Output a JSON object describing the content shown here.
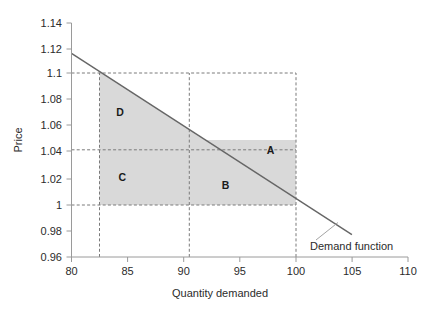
{
  "chart_data": {
    "type": "line",
    "title": "",
    "xlabel": "Quantity demanded",
    "ylabel": "Price",
    "xlim": [
      80,
      110
    ],
    "ylim": [
      0.96,
      1.14
    ],
    "xticks": [
      "80",
      "85",
      "90",
      "95",
      "100",
      "105",
      "110"
    ],
    "xtick_values": [
      80,
      85,
      90,
      95,
      100,
      105,
      110
    ],
    "yticks": [
      "0.96",
      "0.98",
      "1",
      "1.02",
      "1.04",
      "1.06",
      "1.08",
      "1.1",
      "1.12",
      "1.14"
    ],
    "ytick_values": [
      0.96,
      0.98,
      1.0,
      1.02,
      1.04,
      1.06,
      1.08,
      1.1,
      1.12,
      1.14
    ],
    "grid": false,
    "legend_position": "inline-annotation",
    "series": [
      {
        "name": "Demand function",
        "type": "line",
        "color": "#666666",
        "x": [
          80,
          105
        ],
        "y": [
          1.1166,
          0.9772
        ],
        "annotation": "Demand function",
        "annotation_x": 101.5,
        "annotation_y": 0.9845
      }
    ],
    "reference_lines": {
      "horizontal": [
        {
          "value": 1.1,
          "label": "1.1",
          "style": "dashed",
          "from_x": 80,
          "to_x": 100
        },
        {
          "value": 1.05,
          "label": "1.05",
          "style": "dashed",
          "from_x": 80,
          "to_x": 100
        },
        {
          "value": 1.0,
          "label": "1",
          "style": "dashed",
          "from_x": 80,
          "to_x": 100
        }
      ],
      "vertical": [
        {
          "value": 82.5,
          "style": "dashed",
          "from_y": 0.96,
          "to_y": 1.1
        },
        {
          "value": 90.5,
          "style": "dashed",
          "from_y": 0.96,
          "to_y": 1.1
        },
        {
          "value": 100.0,
          "style": "dashed",
          "from_y": 0.96,
          "to_y": 1.1
        }
      ]
    },
    "shaded_regions": [
      {
        "label": "A",
        "fill": "#d9d9d9",
        "label_x": 97.4,
        "label_y": 1.0395
      },
      {
        "label": "B",
        "fill": "#d9d9d9",
        "label_x": 93.4,
        "label_y": 1.0125
      },
      {
        "label": "C",
        "fill": "#d9d9d9",
        "label_x": 84.2,
        "label_y": 1.0185
      },
      {
        "label": "D",
        "fill": "#d9d9d9",
        "label_x": 84.0,
        "label_y": 1.0685
      }
    ],
    "colors": {
      "line": "#666666",
      "shade": "#d9d9d9",
      "axis": "#808080",
      "dash": "#7a7a7a",
      "text": "#2b2b2b"
    }
  }
}
